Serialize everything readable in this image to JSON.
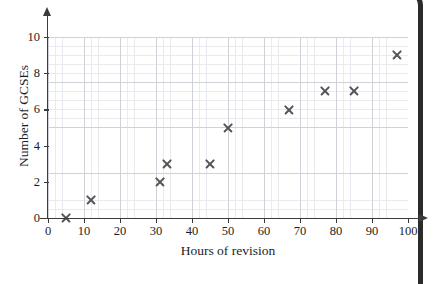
{
  "chart_data": {
    "type": "scatter",
    "title": "",
    "xlabel": "Hours of revision",
    "ylabel": "Number of GCSEs",
    "xlim": [
      0,
      100
    ],
    "ylim": [
      0,
      10
    ],
    "xticks": [
      0,
      10,
      20,
      30,
      40,
      50,
      60,
      70,
      80,
      90,
      100
    ],
    "yticks": [
      0,
      2,
      4,
      6,
      8,
      10
    ],
    "xtick_labels": [
      "0",
      "10",
      "20",
      "30",
      "40",
      "50",
      "60",
      "70",
      "80",
      "90",
      "100"
    ],
    "ytick_labels": [
      "0",
      "2",
      "4",
      "6",
      "8",
      "10"
    ],
    "grid": true,
    "grid_minor": true,
    "legend": false,
    "marker": "x",
    "marker_color": "#555557",
    "grid_major_color": "#cfd2d8",
    "grid_minor_color": "#e9eaee",
    "axis_color": "#3b3b3b",
    "points": [
      {
        "x": 5,
        "y": 0
      },
      {
        "x": 12,
        "y": 1
      },
      {
        "x": 31,
        "y": 2
      },
      {
        "x": 33,
        "y": 3
      },
      {
        "x": 45,
        "y": 3
      },
      {
        "x": 50,
        "y": 5
      },
      {
        "x": 67,
        "y": 6
      },
      {
        "x": 77,
        "y": 7
      },
      {
        "x": 85,
        "y": 7
      },
      {
        "x": 97,
        "y": 9
      }
    ]
  }
}
